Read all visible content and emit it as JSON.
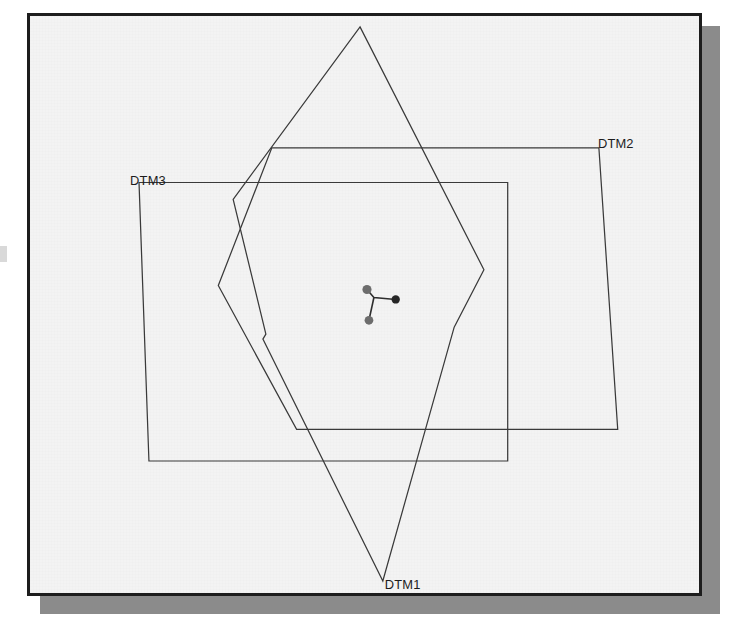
{
  "figure": {
    "kind": "overlaid-polygon-footprint-diagram",
    "background_color": "#f3f3f3",
    "frame_color": "#1d1d1d",
    "shadow_color": "#8b8b8b",
    "line_color": "#3a3a3a",
    "labels": [
      {
        "id": "dtm2",
        "text": "DTM2",
        "x": 600,
        "y": 141
      },
      {
        "id": "dtm3",
        "text": "DTM3",
        "x": 128,
        "y": 180
      },
      {
        "id": "dtm1",
        "text": "DTM1",
        "x": 385,
        "y": 586
      }
    ],
    "center_marker": {
      "name": "tripod-station-marker",
      "hub": {
        "x": 374,
        "y": 297
      },
      "nodes": [
        {
          "x": 367,
          "y": 289,
          "tone": "gray"
        },
        {
          "x": 369,
          "y": 320,
          "tone": "gray"
        },
        {
          "x": 396,
          "y": 299,
          "tone": "dark"
        }
      ]
    },
    "polygons": [
      {
        "id": "dtm2-footprint",
        "label": "DTM2",
        "points": "470,146 601,146 620,430 296,430 217,285 271,146"
      },
      {
        "id": "dtm3-footprint",
        "label": "DTM3",
        "points": "137,181 509,181 509,462 147,462"
      },
      {
        "id": "dtm1-footprint",
        "label": "DTM1",
        "points": "360,24 485,269 455,327 383,583 262,339 265,334 232,198"
      }
    ]
  }
}
